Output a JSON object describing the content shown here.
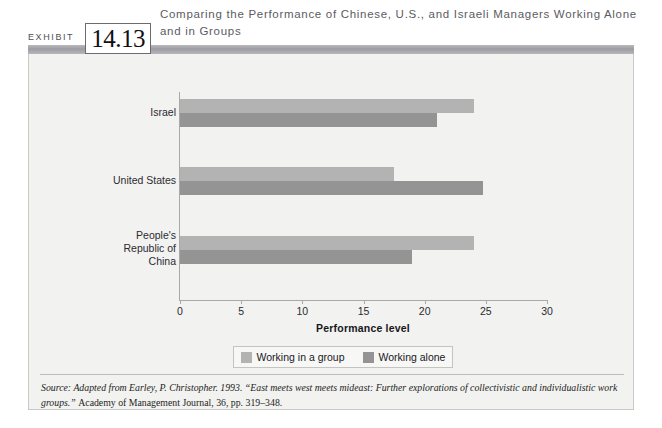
{
  "exhibit": {
    "word": "EXHIBIT",
    "number": "14.13",
    "title": "Comparing the Performance of Chinese, U.S., and Israeli Managers Working Alone and in Groups"
  },
  "chart_data": {
    "type": "bar",
    "orientation": "horizontal",
    "title": "Comparing the Performance of Chinese, U.S., and Israeli Managers Working Alone and in Groups",
    "categories": [
      "Israel",
      "United States",
      "People's Republic of China"
    ],
    "series": [
      {
        "name": "Working in a group",
        "values": [
          24,
          17.5,
          24
        ],
        "color": "#b3b3b3"
      },
      {
        "name": "Working alone",
        "values": [
          21,
          24.8,
          19
        ],
        "color": "#949494"
      }
    ],
    "xlabel": "Performance level",
    "ylabel": "",
    "xlim": [
      0,
      30
    ],
    "xticks": [
      0,
      5,
      10,
      15,
      20,
      25,
      30
    ],
    "xtick_labels": [
      "0",
      "5",
      "10",
      "15",
      "20",
      "25",
      "30"
    ],
    "grid": false,
    "legend_position": "bottom"
  },
  "axis": {
    "x_title": "Performance level",
    "ticks": [
      "0",
      "5",
      "10",
      "15",
      "20",
      "25",
      "30"
    ]
  },
  "categories": [
    {
      "label": "Israel",
      "lines": [
        "Israel"
      ]
    },
    {
      "label": "United States",
      "lines": [
        "United States"
      ]
    },
    {
      "label": "People's Republic of China",
      "lines": [
        "People's",
        "Republic of",
        "China"
      ]
    }
  ],
  "legend": {
    "items": [
      {
        "label": "Working in a group",
        "color": "#b3b3b3"
      },
      {
        "label": "Working alone",
        "color": "#949494"
      }
    ]
  },
  "source": {
    "part1": "Source: Adapted from Earley, P. Christopher. 1993. “East meets west meets mideast: Further explorations of collectivistic and individualistic work groups.” ",
    "part2": "Academy of Management Journal, 36, pp. 319–348."
  },
  "colors": {
    "panel_bg": "#f2f2f0",
    "bar_group": "#b3b3b3",
    "bar_alone": "#949494",
    "header_rule": "#9c9ca2",
    "axis": "#a9a9a6"
  }
}
